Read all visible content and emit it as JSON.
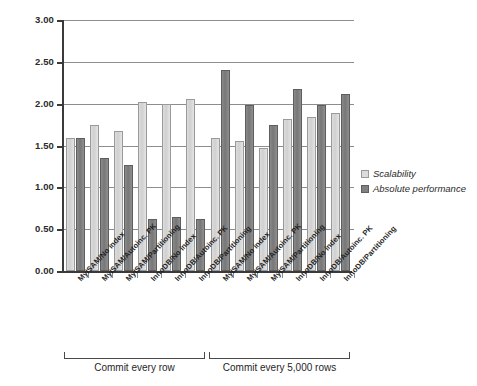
{
  "chart_data": {
    "type": "bar",
    "title": "",
    "xlabel": "",
    "ylabel": "",
    "ylim": [
      0.0,
      3.0
    ],
    "ytick_labels": [
      "0.00",
      "0.50",
      "1.00",
      "1.50",
      "2.00",
      "2.50",
      "3.00"
    ],
    "ytick_values": [
      0.0,
      0.5,
      1.0,
      1.5,
      2.0,
      2.5,
      3.0
    ],
    "grid": true,
    "legend_position": "right",
    "categories": [
      "MyISAM/No index",
      "MyISAM/Autoinc. PK",
      "MyISAM/Partitioning",
      "InnoDB/No index",
      "InnoDB/Autoinc. PK",
      "InnoDB/Partitioning",
      "MyISAM/No index",
      "MyISAM/Autoinc. PK",
      "MyISAM/Partitioning",
      "InnoDB/No index",
      "InnoDB/Autoinc. PK",
      "InnoDB/Partitioning"
    ],
    "series": [
      {
        "name": "Scalability",
        "color": "#d3d3d3",
        "values": [
          1.59,
          1.74,
          1.67,
          2.02,
          2.0,
          2.06,
          1.59,
          1.55,
          1.47,
          1.82,
          1.84,
          1.89
        ]
      },
      {
        "name": "Absolute performance",
        "color": "#7a7a7a",
        "values": [
          1.59,
          1.35,
          1.27,
          0.62,
          0.64,
          0.62,
          2.4,
          1.98,
          1.74,
          2.17,
          1.98,
          2.12
        ]
      }
    ],
    "group_brackets": [
      {
        "label": "Commit every row",
        "from_index": 0,
        "to_index": 5
      },
      {
        "label": "Commit every 5,000 rows",
        "from_index": 6,
        "to_index": 11
      }
    ]
  }
}
